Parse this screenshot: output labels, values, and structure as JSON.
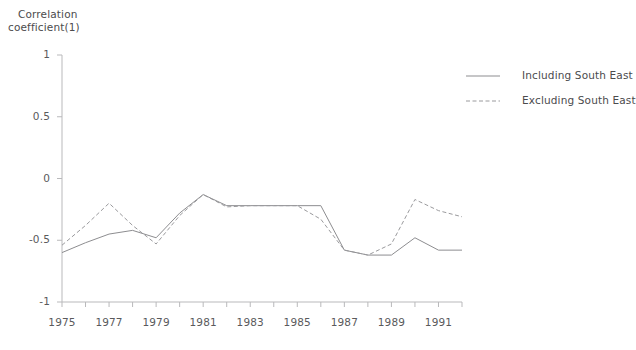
{
  "figure": {
    "background": "#ffffff",
    "axis_color": "#b9b9bb",
    "text_color": "#58585a"
  },
  "axis_title": {
    "line1": "Correlation",
    "line2": "coefficient(1)"
  },
  "legend": {
    "position": "right",
    "entries": [
      {
        "label": "Including South East",
        "style": "solid",
        "color": "#8d8d90"
      },
      {
        "label": "Excluding South East",
        "style": "dashed",
        "color": "#9a9a9d"
      }
    ]
  },
  "y_axis": {
    "ticks": [
      "1",
      "0.5",
      "0",
      "-0.5",
      "-1"
    ],
    "values": [
      1,
      0.5,
      0,
      -0.5,
      -1
    ],
    "min": -1,
    "max": 1
  },
  "x_axis": {
    "labels": [
      "1975",
      "1977",
      "1979",
      "1981",
      "1983",
      "1985",
      "1987",
      "1989",
      "1991"
    ],
    "label_values": [
      1975,
      1977,
      1979,
      1981,
      1983,
      1985,
      1987,
      1989,
      1991
    ],
    "tick_values": [
      1975,
      1976,
      1977,
      1978,
      1979,
      1980,
      1981,
      1982,
      1983,
      1984,
      1985,
      1986,
      1987,
      1988,
      1989,
      1990,
      1991
    ],
    "min": 1975,
    "max": 1992
  },
  "chart_data": {
    "type": "line",
    "title": "",
    "subtitle": "",
    "xlabel": "",
    "ylabel": "Correlation coefficient(1)",
    "xlim": [
      1975,
      1992
    ],
    "ylim": [
      -1,
      1
    ],
    "grid": false,
    "legend_position": "right",
    "x": [
      1975,
      1976,
      1977,
      1978,
      1979,
      1980,
      1981,
      1982,
      1983,
      1984,
      1985,
      1986,
      1987,
      1988,
      1989,
      1990,
      1991,
      1992
    ],
    "series": [
      {
        "name": "Including South East",
        "style": "solid",
        "color": "#8d8d90",
        "values": [
          -0.6,
          -0.52,
          -0.45,
          -0.42,
          -0.48,
          -0.28,
          -0.13,
          -0.22,
          -0.22,
          -0.22,
          -0.22,
          -0.22,
          -0.58,
          -0.62,
          -0.62,
          -0.48,
          -0.58,
          -0.58
        ]
      },
      {
        "name": "Excluding South East",
        "style": "dashed",
        "color": "#9a9a9d",
        "values": [
          -0.54,
          -0.38,
          -0.2,
          -0.38,
          -0.53,
          -0.3,
          -0.13,
          -0.23,
          -0.22,
          -0.22,
          -0.22,
          -0.33,
          -0.58,
          -0.62,
          -0.53,
          -0.17,
          -0.26,
          -0.31
        ]
      }
    ]
  }
}
